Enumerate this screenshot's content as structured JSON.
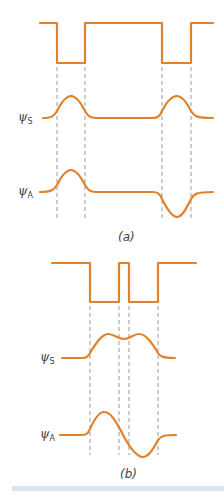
{
  "colors": {
    "wave": "#e0812c",
    "dash": "#9a9a9a",
    "label": "#444444",
    "bar": "#d6e6ec"
  },
  "panels": [
    {
      "id": "a",
      "caption": "(a)",
      "description": "Two separated square potential wells and their symmetric and antisymmetric wavefunctions",
      "labels": {
        "psi_s": "ψ",
        "psi_s_sub": "S",
        "psi_a": "ψ",
        "psi_a_sub": "A"
      }
    },
    {
      "id": "b",
      "caption": "(b)",
      "description": "Two closely spaced square potential wells and their symmetric and antisymmetric wavefunctions",
      "labels": {
        "psi_s": "ψ",
        "psi_s_sub": "S",
        "psi_a": "ψ",
        "psi_a_sub": "A"
      }
    }
  ]
}
